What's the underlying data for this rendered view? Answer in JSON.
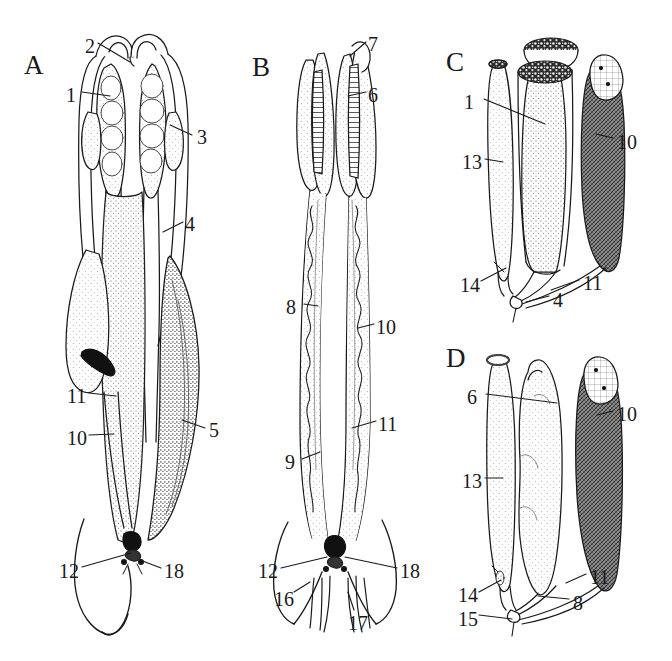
{
  "figure": {
    "background_color": "#ffffff",
    "ink_color": "#1a1a1a",
    "width": 672,
    "height": 661
  },
  "panels": [
    {
      "letter": "A",
      "x": 24,
      "y": 52
    },
    {
      "letter": "B",
      "x": 252,
      "y": 54
    },
    {
      "letter": "C",
      "x": 446,
      "y": 49
    },
    {
      "letter": "D",
      "x": 446,
      "y": 345
    }
  ],
  "labels": [
    {
      "text": "2",
      "x": 85,
      "y": 36,
      "panel": "A"
    },
    {
      "text": "1",
      "x": 66,
      "y": 85,
      "panel": "A"
    },
    {
      "text": "3",
      "x": 197,
      "y": 127,
      "panel": "A"
    },
    {
      "text": "4",
      "x": 185,
      "y": 214,
      "panel": "A"
    },
    {
      "text": "11",
      "x": 67,
      "y": 386,
      "panel": "A"
    },
    {
      "text": "10",
      "x": 67,
      "y": 428,
      "panel": "A"
    },
    {
      "text": "5",
      "x": 209,
      "y": 420,
      "panel": "A"
    },
    {
      "text": "12",
      "x": 59,
      "y": 561,
      "panel": "A"
    },
    {
      "text": "18",
      "x": 164,
      "y": 561,
      "panel": "A"
    },
    {
      "text": "7",
      "x": 368,
      "y": 34,
      "panel": "B"
    },
    {
      "text": "6",
      "x": 368,
      "y": 85,
      "panel": "B"
    },
    {
      "text": "8",
      "x": 286,
      "y": 297,
      "panel": "B"
    },
    {
      "text": "10",
      "x": 376,
      "y": 317,
      "panel": "B"
    },
    {
      "text": "11",
      "x": 378,
      "y": 414,
      "panel": "B"
    },
    {
      "text": "9",
      "x": 285,
      "y": 452,
      "panel": "B"
    },
    {
      "text": "12",
      "x": 258,
      "y": 561,
      "panel": "B"
    },
    {
      "text": "18",
      "x": 400,
      "y": 561,
      "panel": "B"
    },
    {
      "text": "16",
      "x": 274,
      "y": 589,
      "panel": "B"
    },
    {
      "text": "17",
      "x": 348,
      "y": 613,
      "panel": "B"
    },
    {
      "text": "1",
      "x": 464,
      "y": 92,
      "panel": "C"
    },
    {
      "text": "10",
      "x": 617,
      "y": 132,
      "panel": "C"
    },
    {
      "text": "13",
      "x": 462,
      "y": 152,
      "panel": "C"
    },
    {
      "text": "14",
      "x": 460,
      "y": 275,
      "panel": "C"
    },
    {
      "text": "11",
      "x": 583,
      "y": 273,
      "panel": "C"
    },
    {
      "text": "4",
      "x": 553,
      "y": 290,
      "panel": "C"
    },
    {
      "text": "6",
      "x": 467,
      "y": 387,
      "panel": "D"
    },
    {
      "text": "10",
      "x": 617,
      "y": 404,
      "panel": "D"
    },
    {
      "text": "13",
      "x": 462,
      "y": 471,
      "panel": "D"
    },
    {
      "text": "11",
      "x": 590,
      "y": 567,
      "panel": "D"
    },
    {
      "text": "8",
      "x": 573,
      "y": 593,
      "panel": "D"
    },
    {
      "text": "14",
      "x": 458,
      "y": 585,
      "panel": "D"
    },
    {
      "text": "15",
      "x": 458,
      "y": 609,
      "panel": "D"
    }
  ],
  "legend_numbers": [
    "1",
    "2",
    "3",
    "4",
    "5",
    "6",
    "7",
    "8",
    "9",
    "10",
    "11",
    "12",
    "13",
    "14",
    "15",
    "16",
    "17",
    "18"
  ]
}
